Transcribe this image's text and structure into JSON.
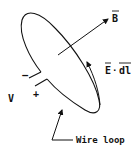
{
  "diagram": {
    "labels": {
      "magnetic_field": "B",
      "line_integral_e": "E",
      "line_integral_dot": "·",
      "line_integral_dl": "dl",
      "voltage": "V",
      "minus": "−",
      "plus": "+",
      "wire_loop": "Wire loop"
    },
    "colors": {
      "stroke": "#111111",
      "background": "#ffffff"
    }
  }
}
